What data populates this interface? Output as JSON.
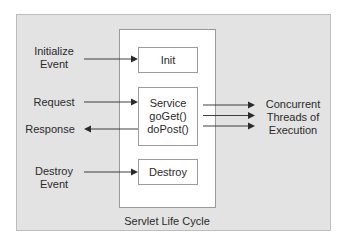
{
  "diagram": {
    "title": "Servlet Life Cycle",
    "colors": {
      "outer_panel": "#e3e3e3",
      "inner_panel": "#ffffff",
      "stroke": "#2a2a2a",
      "text": "#2a2a2a"
    },
    "left_labels": {
      "initialize": [
        "Initialize",
        "Event"
      ],
      "request": "Request",
      "response": "Response",
      "destroy": [
        "Destroy",
        "Event"
      ]
    },
    "boxes": {
      "init": {
        "lines": [
          "Init"
        ]
      },
      "service": {
        "lines": [
          "Service",
          "goGet()",
          "doPost()"
        ]
      },
      "destroy": {
        "lines": [
          "Destroy"
        ]
      }
    },
    "right_label": [
      "Concurrent",
      "Threads of",
      "Execution"
    ],
    "edges": [
      {
        "from": "Initialize Event",
        "to": "Init",
        "direction": "right"
      },
      {
        "from": "Request",
        "to": "Service",
        "direction": "right"
      },
      {
        "from": "Service",
        "to": "Response",
        "direction": "left"
      },
      {
        "from": "Destroy Event",
        "to": "Destroy",
        "direction": "right"
      },
      {
        "from": "Service",
        "to": "Concurrent Threads of Execution",
        "direction": "right",
        "count": 3
      }
    ]
  }
}
